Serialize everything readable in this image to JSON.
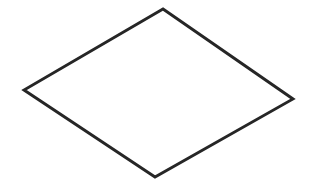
{
  "canvas": {
    "width": 314,
    "height": 183,
    "background_color": "#ffffff",
    "description": "blank white drawing canvas"
  },
  "figure": {
    "name": "rhombus-outline",
    "shape_type": "quadrilateral",
    "shape_label": "rhombus",
    "style": "hand-drawn outline",
    "stroke_color": "#262626",
    "stroke_width": 2.9,
    "fill_color": "none",
    "closed": true,
    "vertex_count": 4,
    "vertices": [
      {
        "name": "top-vertex",
        "x": 163,
        "y": 9
      },
      {
        "name": "right-vertex",
        "x": 293,
        "y": 99
      },
      {
        "name": "bottom-vertex",
        "x": 155,
        "y": 177
      },
      {
        "name": "left-vertex",
        "x": 24,
        "y": 90
      }
    ],
    "points_attr": "163,9 293,99 155,177 24,90",
    "edges": [
      {
        "name": "top-right-edge",
        "from": "top-vertex",
        "to": "right-vertex"
      },
      {
        "name": "bottom-right-edge",
        "from": "right-vertex",
        "to": "bottom-vertex"
      },
      {
        "name": "bottom-left-edge",
        "from": "bottom-vertex",
        "to": "left-vertex"
      },
      {
        "name": "top-left-edge",
        "from": "left-vertex",
        "to": "top-vertex"
      }
    ]
  }
}
